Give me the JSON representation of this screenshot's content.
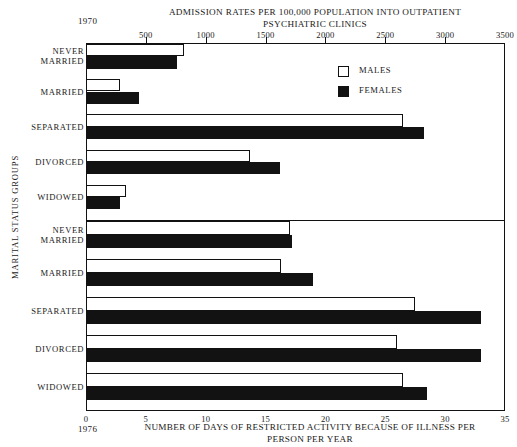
{
  "figure": {
    "top_title": "ADMISSION RATES PER 100,000 POPULATION\nINTO OUTPATIENT PSYCHIATRIC CLINICS",
    "bottom_title": "NUMBER OF DAYS OF RESTRICTED ACTIVITY BECAUSE\nOF ILLNESS PER PERSON PER YEAR",
    "year_top": "1970",
    "year_bottom": "1976",
    "y_axis_title": "MARITAL STATUS GROUPS"
  },
  "legend": {
    "position": "inside-top-right",
    "items": [
      {
        "label": "MALES",
        "key": "males",
        "color": "#ffffff"
      },
      {
        "label": "FEMALES",
        "key": "females",
        "color": "#121212"
      }
    ]
  },
  "chart_data": [
    {
      "id": "upper",
      "type": "bar",
      "orientation": "horizontal",
      "title": "ADMISSION RATES PER 100,000 POPULATION INTO OUTPATIENT PSYCHIATRIC CLINICS",
      "xlabel": "ADMISSION RATES PER 100,000 POPULATION INTO OUTPATIENT PSYCHIATRIC CLINICS",
      "ylabel": "MARITAL STATUS GROUPS",
      "year": "1970",
      "xlim": [
        0,
        3500
      ],
      "xticks": [
        0,
        500,
        1000,
        1500,
        2000,
        2500,
        3000,
        3500
      ],
      "xticklabels": [
        "",
        "500",
        "1000",
        "1500",
        "2000",
        "2500",
        "3000",
        "3500"
      ],
      "grid": false,
      "categories": [
        "NEVER MARRIED",
        "MARRIED",
        "SEPARATED",
        "DIVORCED",
        "WIDOWED"
      ],
      "series": [
        {
          "name": "MALES",
          "values": [
            820,
            285,
            2650,
            1370,
            330
          ]
        },
        {
          "name": "FEMALES",
          "values": [
            760,
            440,
            2820,
            1620,
            285
          ]
        }
      ]
    },
    {
      "id": "lower",
      "type": "bar",
      "orientation": "horizontal",
      "title": "NUMBER OF DAYS OF RESTRICTED ACTIVITY BECAUSE OF ILLNESS PER PERSON PER YEAR",
      "xlabel": "NUMBER OF DAYS OF RESTRICTED ACTIVITY BECAUSE OF ILLNESS PER PERSON PER YEAR",
      "ylabel": "MARITAL STATUS GROUPS",
      "year": "1976",
      "xlim": [
        0,
        35
      ],
      "xticks": [
        0,
        5,
        10,
        15,
        20,
        25,
        30,
        35
      ],
      "xticklabels": [
        "0",
        "5",
        "10",
        "15",
        "20",
        "25",
        "30",
        "35"
      ],
      "grid": false,
      "categories": [
        "NEVER MARRIED",
        "MARRIED",
        "SEPARATED",
        "DIVORCED",
        "WIDOWED"
      ],
      "series": [
        {
          "name": "MALES",
          "values": [
            17.0,
            16.3,
            27.5,
            26.0,
            26.5
          ]
        },
        {
          "name": "FEMALES",
          "values": [
            17.2,
            19.0,
            33.0,
            33.0,
            28.5
          ]
        }
      ]
    }
  ]
}
